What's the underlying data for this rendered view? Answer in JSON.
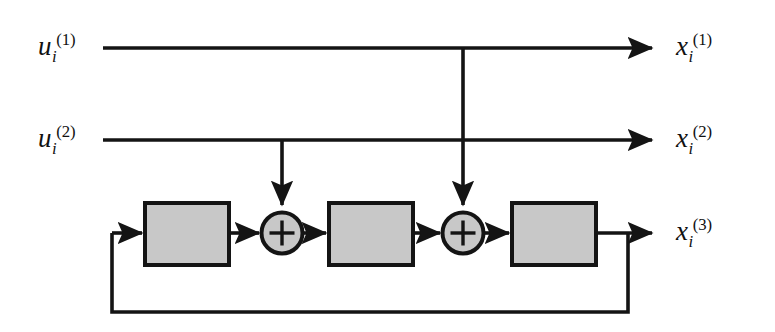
{
  "diagram": {
    "canvas": {
      "width": 775,
      "height": 332,
      "background": "#ffffff"
    },
    "colors": {
      "line": "#141414",
      "block_fill": "#c8c8c8",
      "block_stroke": "#141414",
      "adder_fill": "#c8c8c8",
      "adder_stroke": "#141414",
      "text": "#111111"
    },
    "labels": {
      "input_1": {
        "base": "u",
        "sub": "i",
        "sup": "(1)"
      },
      "input_2": {
        "base": "u",
        "sub": "i",
        "sup": "(2)"
      },
      "output_1": {
        "base": "x",
        "sub": "i",
        "sup": "(1)"
      },
      "output_2": {
        "base": "x",
        "sub": "i",
        "sup": "(2)"
      },
      "output_3": {
        "base": "x",
        "sub": "i",
        "sup": "(3)"
      }
    },
    "blocks": [
      {
        "name": "block-1",
        "x": 145,
        "y": 203,
        "width": 84,
        "height": 62,
        "label": ""
      },
      {
        "name": "block-2",
        "x": 329,
        "y": 203,
        "width": 84,
        "height": 62,
        "label": ""
      },
      {
        "name": "block-3",
        "x": 512,
        "y": 203,
        "width": 84,
        "height": 62,
        "label": ""
      }
    ],
    "adders": [
      {
        "name": "adder-1",
        "cx": 282,
        "cy": 233,
        "r": 21,
        "symbol": "+"
      },
      {
        "name": "adder-2",
        "cx": 463,
        "cy": 233,
        "r": 21,
        "symbol": "+"
      }
    ],
    "signal_paths": [
      {
        "name": "path-input-1",
        "y": 48,
        "x_start": 103,
        "x_end": 655,
        "branch_x": 463
      },
      {
        "name": "path-input-2",
        "y": 140,
        "x_start": 103,
        "x_end": 655,
        "branch_x": 282
      },
      {
        "name": "path-output-3",
        "y": 233,
        "x_start": 596,
        "x_end": 655,
        "feedback_tap_x": 628
      }
    ],
    "feedback": {
      "name": "feedback-loop",
      "tap_x": 628,
      "bottom_y": 312,
      "left_x": 112,
      "return_y": 233
    }
  }
}
